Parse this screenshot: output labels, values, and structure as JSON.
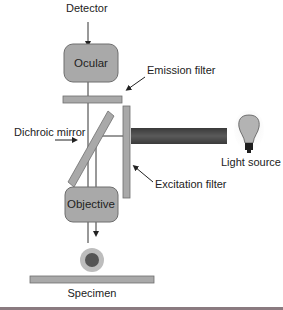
{
  "diagram": {
    "labels": {
      "detector": "Detector",
      "ocular": "Ocular",
      "emission_filter": "Emission filter",
      "dichroic_mirror": "Dichroic mirror",
      "light_source": "Light source",
      "excitation_filter": "Excitation filter",
      "objective": "Objective",
      "specimen": "Specimen"
    },
    "colors": {
      "component_fill": "#a9a9a9",
      "component_stroke": "#6e6e6e",
      "beam": "#4a4a4a",
      "line": "#333333",
      "bulb_glow": "#e0e0e0",
      "specimen_outer": "#b5b5b5",
      "specimen_inner": "#555555",
      "bottom_rule": "#8a7a80"
    }
  }
}
